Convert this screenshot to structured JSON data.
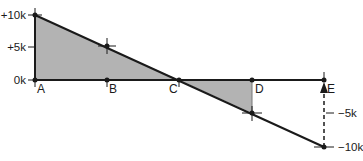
{
  "diagram": {
    "type": "waterfall-cumulative",
    "y_axis_labels": [
      "+10k",
      "+5k",
      "0k",
      "−5k",
      "−10k"
    ],
    "points": [
      {
        "label": "A",
        "value": 10000
      },
      {
        "label": "B",
        "value": 5000
      },
      {
        "label": "C",
        "value": 0
      },
      {
        "label": "D",
        "value": -5000
      },
      {
        "label": "E",
        "value": -10000
      }
    ],
    "colors": {
      "line": "#1a1a1a",
      "fill": "#b3b3b3",
      "dashed_arrow": "#1a1a1a"
    }
  }
}
